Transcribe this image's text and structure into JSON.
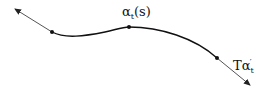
{
  "diagram": {
    "curve_label": {
      "symbol": "α",
      "subscript": "t",
      "argument": "(s)"
    },
    "tangent_label": {
      "prefix": "T",
      "symbol": "α",
      "superscript": "′",
      "subscript": "t"
    },
    "points": [
      {
        "x": 52,
        "y": 32
      },
      {
        "x": 129,
        "y": 27
      },
      {
        "x": 217,
        "y": 58
      }
    ],
    "colors": {
      "curve": "#111111",
      "tangent": "#555555",
      "points": "#111111"
    }
  }
}
